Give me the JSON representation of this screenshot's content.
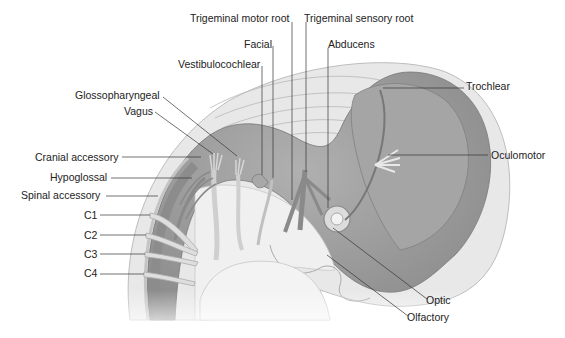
{
  "figure": {
    "colors": {
      "background": "#ffffff",
      "outer_tissue": "#e6e6e6",
      "outer_tissue_edge": "#bdbdbd",
      "brain_tube": "#9a9a9a",
      "brain_tube_dark": "#7c7c7c",
      "nerve": "#8a8a8a",
      "nerve_light": "#d8d8d8",
      "leader_line": "#333333",
      "label_text": "#222222"
    },
    "labels": {
      "trigeminal_motor_root": "Trigeminal motor root",
      "trigeminal_sensory_root": "Trigeminal sensory root",
      "facial": "Facial",
      "abducens": "Abducens",
      "vestibulocochlear": "Vestibulocochlear",
      "trochlear": "Trochlear",
      "glossopharyngeal": "Glossopharyngeal",
      "vagus": "Vagus",
      "oculomotor": "Oculomotor",
      "cranial_accessory": "Cranial accessory",
      "hypoglossal": "Hypoglossal",
      "spinal_accessory": "Spinal accessory",
      "c1": "C1",
      "c2": "C2",
      "c3": "C3",
      "c4": "C4",
      "optic": "Optic",
      "olfactory": "Olfactory"
    }
  }
}
